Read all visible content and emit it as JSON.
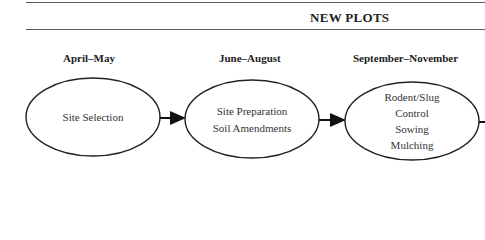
{
  "header": {
    "title": "NEW PLOTS"
  },
  "phases": [
    {
      "period": "April–May",
      "steps": [
        "Site Selection"
      ]
    },
    {
      "period": "June–August",
      "steps": [
        "Site Preparation",
        "Soil Amendments"
      ]
    },
    {
      "period": "September–November",
      "steps": [
        "Rodent/Slug",
        "Control",
        "Sowing",
        "Mulching"
      ]
    }
  ]
}
